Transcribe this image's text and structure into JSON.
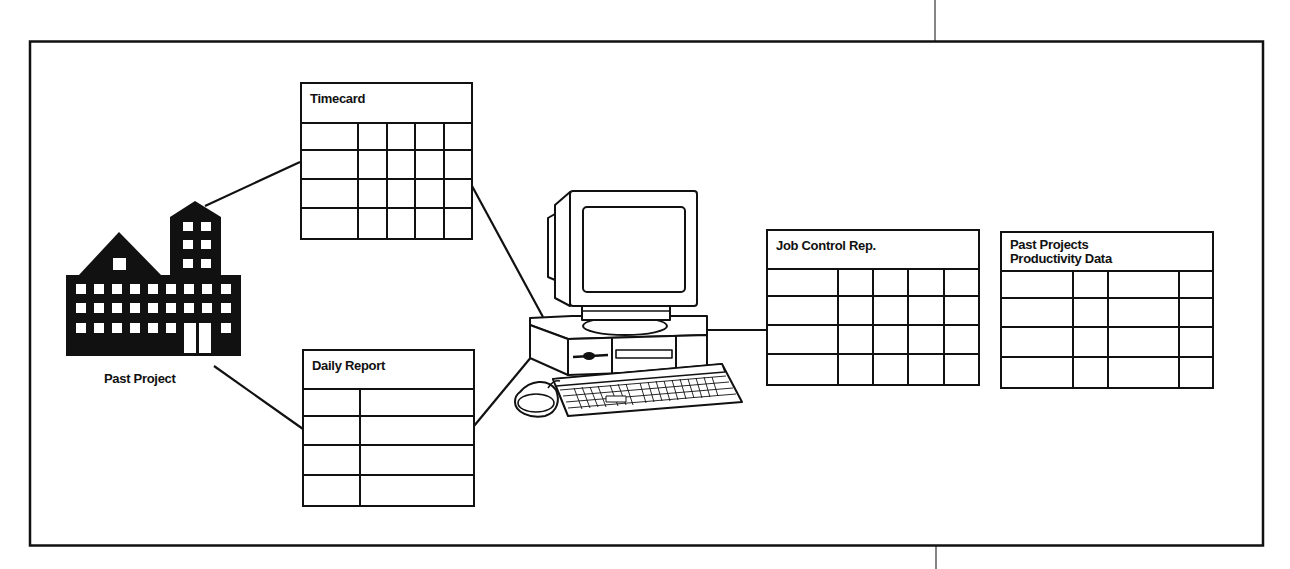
{
  "diagram": {
    "frame": {
      "x": 29,
      "y": 41,
      "w": 1234,
      "h": 505
    },
    "source": {
      "label": "Past Project",
      "icon": "building-icon"
    },
    "hub": {
      "icon": "desktop-computer-icon",
      "parts": [
        "monitor",
        "system-unit",
        "keyboard",
        "mouse"
      ]
    },
    "tables": [
      {
        "id": "timecard",
        "title": "Timecard",
        "x": 300,
        "y": 82,
        "w": 173,
        "h": 158,
        "header_h": 40,
        "columns": [
          57,
          29,
          28,
          29,
          30
        ],
        "rows": 4
      },
      {
        "id": "daily-report",
        "title": "Daily Report",
        "x": 302,
        "y": 349,
        "w": 173,
        "h": 158,
        "header_h": 39,
        "columns": [
          57,
          116
        ],
        "rows": 4
      },
      {
        "id": "job-control-rep",
        "title": "Job Control Rep.",
        "x": 766,
        "y": 229,
        "w": 214,
        "h": 157,
        "header_h": 39,
        "columns": [
          71,
          35,
          35,
          36,
          37
        ],
        "rows": 4
      },
      {
        "id": "past-projects-productivity-data",
        "title": "Past Projects Productivity Data",
        "title_lines": [
          "Past Projects",
          "Productivity Data"
        ],
        "x": 1000,
        "y": 231,
        "w": 214,
        "h": 158,
        "header_h": 39,
        "columns": [
          72,
          35,
          71,
          36
        ],
        "rows": 4
      }
    ],
    "connectors": [
      {
        "from": "past-project",
        "to": "timecard",
        "x1": 205,
        "y1": 206,
        "x2": 300,
        "y2": 162
      },
      {
        "from": "past-project",
        "to": "daily-report",
        "x1": 214,
        "y1": 366,
        "x2": 303,
        "y2": 429
      },
      {
        "from": "timecard",
        "to": "computer",
        "x1": 472,
        "y1": 186,
        "x2": 543,
        "y2": 317
      },
      {
        "from": "daily-report",
        "to": "computer",
        "x1": 474,
        "y1": 426,
        "x2": 537,
        "y2": 350
      },
      {
        "from": "computer",
        "to": "job-control-rep",
        "x1": 700,
        "y1": 330,
        "x2": 767,
        "y2": 330
      }
    ],
    "colors": {
      "ink": "#111111",
      "background": "#ffffff"
    }
  }
}
